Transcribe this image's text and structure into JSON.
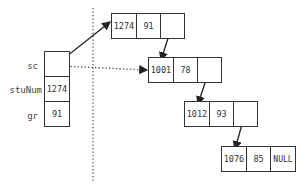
{
  "diagram": {
    "type": "linked-list-memory",
    "divider": "dotted-vertical",
    "variables": [
      {
        "name": "sc",
        "value": ""
      },
      {
        "name": "stuNum",
        "value": "1274"
      },
      {
        "name": "gr",
        "value": "91"
      }
    ],
    "nodes": [
      {
        "id": "n1",
        "stuNum": "1274",
        "grade": "91",
        "next": ""
      },
      {
        "id": "n2",
        "stuNum": "1001",
        "grade": "78",
        "next": ""
      },
      {
        "id": "n3",
        "stuNum": "1012",
        "grade": "93",
        "next": ""
      },
      {
        "id": "n4",
        "stuNum": "1076",
        "grade": "85",
        "next": "NULL"
      }
    ],
    "edges": [
      {
        "from": "sc",
        "to": "n1",
        "style": "solid"
      },
      {
        "from": "sc",
        "to": "n2",
        "style": "dotted"
      },
      {
        "from": "n1",
        "to": "n2",
        "style": "solid"
      },
      {
        "from": "n2",
        "to": "n3",
        "style": "solid"
      },
      {
        "from": "n3",
        "to": "n4",
        "style": "solid"
      }
    ],
    "colors": {
      "line": "#333333",
      "background": "#ffffff"
    }
  }
}
